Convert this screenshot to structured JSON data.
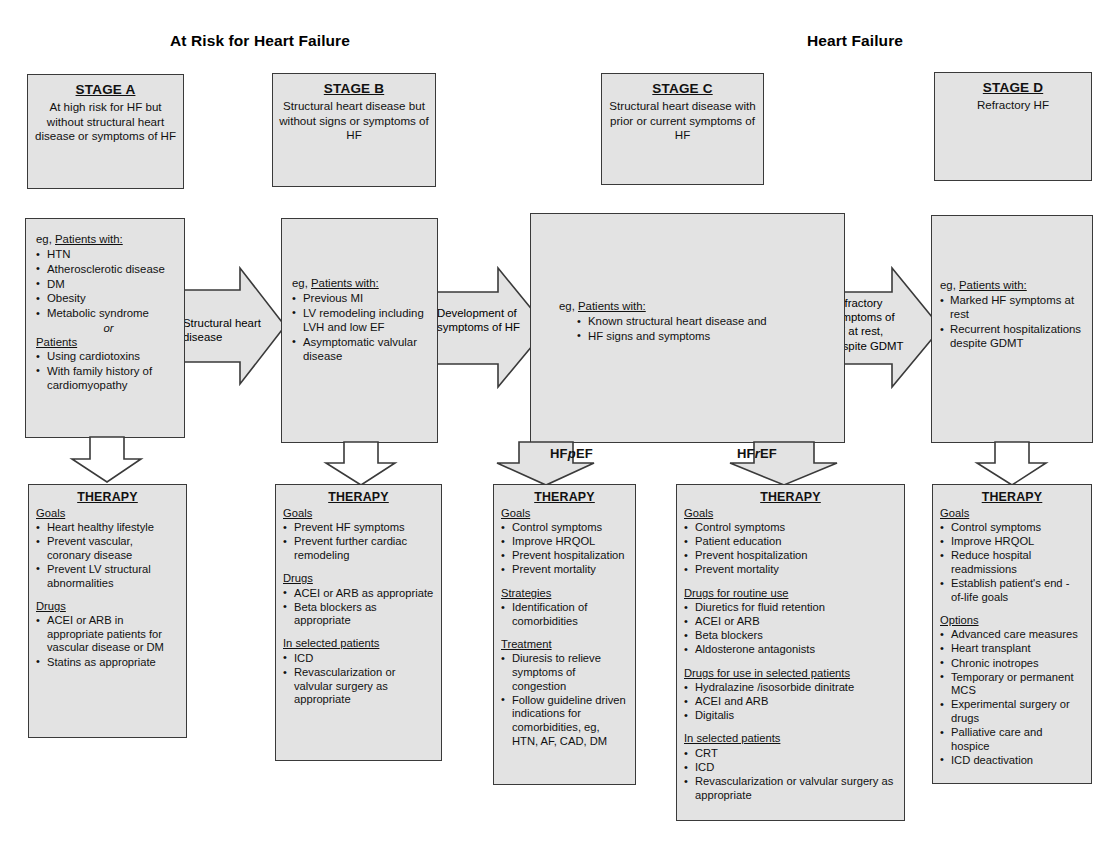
{
  "headers": {
    "left": "At Risk for Heart Failure",
    "right": "Heart Failure"
  },
  "stages": [
    {
      "id": "a",
      "title": "STAGE A",
      "subtitle": "At high risk for HF but without structural heart disease or symptoms of HF"
    },
    {
      "id": "b",
      "title": "STAGE B",
      "subtitle": "Structural heart disease but without signs or symptoms of HF"
    },
    {
      "id": "c",
      "title": "STAGE C",
      "subtitle": "Structural heart disease with prior or current symptoms of HF"
    },
    {
      "id": "d",
      "title": "STAGE D",
      "subtitle": "Refractory HF"
    }
  ],
  "descriptions": {
    "a": {
      "lead": "eg, Patients with:",
      "lead_plain": "eg, ",
      "lead_underlined": "Patients with:",
      "items": [
        "HTN",
        "Atherosclerotic disease",
        "DM",
        "Obesity",
        "Metabolic syndrome"
      ],
      "conjunction": "or",
      "second_lead": "Patients",
      "second_items": [
        "Using cardiotoxins",
        "With family history of cardiomyopathy"
      ]
    },
    "b": {
      "lead_plain": "eg, ",
      "lead_underlined": "Patients with:",
      "items": [
        "Previous MI",
        "LV remodeling including LVH and low EF",
        "Asymptomatic valvular disease"
      ]
    },
    "c": {
      "lead_plain": "eg, ",
      "lead_underlined": "Patients with:",
      "items": [
        "Known structural heart disease and",
        "HF signs and symptoms"
      ]
    },
    "d": {
      "lead_plain": "eg, ",
      "lead_underlined": "Patients with:",
      "items": [
        "Marked HF symptoms at rest",
        "Recurrent hospitalizations despite GDMT"
      ]
    }
  },
  "transition_arrows": [
    {
      "id": "a-to-b",
      "label": "Structural heart disease"
    },
    {
      "id": "b-to-c",
      "label": "Development of symptoms of HF"
    },
    {
      "id": "c-to-d",
      "label": "Refractory symptoms of HF at rest, despite GDMT"
    }
  ],
  "ef_labels": {
    "preserved_prefix": "HF",
    "preserved_italic": "p",
    "preserved_suffix": "EF",
    "reduced_prefix": "HF",
    "reduced_italic": "r",
    "reduced_suffix": "EF"
  },
  "therapies": {
    "a": {
      "title": "THERAPY",
      "sections": [
        {
          "heading": "Goals",
          "items": [
            "Heart healthy lifestyle",
            "Prevent vascular, coronary disease",
            "Prevent LV structural abnormalities"
          ]
        },
        {
          "heading": "Drugs",
          "items": [
            "ACEI or ARB in appropriate patients for vascular disease or DM",
            "Statins as appropriate"
          ]
        }
      ]
    },
    "b": {
      "title": "THERAPY",
      "sections": [
        {
          "heading": "Goals",
          "items": [
            "Prevent HF symptoms",
            "Prevent further cardiac remodeling"
          ]
        },
        {
          "heading": "Drugs",
          "items": [
            "ACEI or ARB  as appropriate",
            "Beta blockers as appropriate"
          ]
        },
        {
          "heading": "In selected patients",
          "items": [
            "ICD",
            "Revascularization or valvular surgery as appropriate"
          ]
        }
      ]
    },
    "hfpef": {
      "title": "THERAPY",
      "sections": [
        {
          "heading": "Goals",
          "items": [
            "Control symptoms",
            "Improve HRQOL",
            "Prevent hospitalization",
            "Prevent mortality"
          ]
        },
        {
          "heading": "Strategies",
          "items": [
            "Identification of comorbidities"
          ]
        },
        {
          "heading": "Treatment",
          "items": [
            "Diuresis to relieve symptoms of congestion",
            "Follow guideline driven indications for comorbidities, eg, HTN, AF, CAD, DM"
          ]
        }
      ]
    },
    "hfref": {
      "title": "THERAPY",
      "sections": [
        {
          "heading": "Goals",
          "items": [
            "Control symptoms",
            "Patient education",
            "Prevent hospitalization",
            "Prevent mortality"
          ]
        },
        {
          "heading": "Drugs for routine use",
          "items": [
            "Diuretics for fluid retention",
            "ACEI or ARB",
            "Beta blockers",
            "Aldosterone antagonists"
          ]
        },
        {
          "heading": "Drugs for use in selected patients",
          "items": [
            "Hydralazine /isosorbide dinitrate",
            "ACEI and ARB",
            "Digitalis"
          ]
        },
        {
          "heading": "In selected patients",
          "items": [
            "CRT",
            "ICD",
            "Revascularization or valvular surgery as appropriate"
          ]
        }
      ]
    },
    "d": {
      "title": "THERAPY",
      "sections": [
        {
          "heading": "Goals",
          "items": [
            "Control symptoms",
            "Improve HRQOL",
            "Reduce hospital readmissions",
            "Establish patient's end - of-life goals"
          ]
        },
        {
          "heading": "Options",
          "items": [
            "Advanced care measures",
            "Heart transplant",
            "Chronic inotropes",
            "Temporary or permanent MCS",
            "Experimental surgery or drugs",
            "Palliative care and hospice",
            "ICD deactivation"
          ]
        }
      ]
    }
  },
  "colors": {
    "box_fill": "#e3e3e3",
    "box_border": "#3a3a3a",
    "arrow_fill": "#e3e3e3",
    "text": "#111111",
    "background": "#ffffff"
  }
}
